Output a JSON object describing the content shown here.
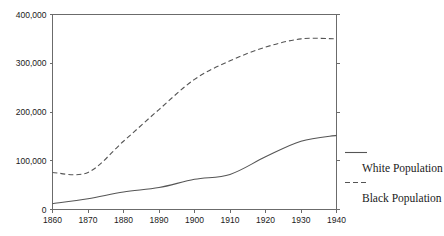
{
  "chart_data": {
    "type": "line",
    "title": "",
    "subtitle": "",
    "xlabel": "",
    "ylabel": "",
    "x": [
      1860,
      1870,
      1880,
      1890,
      1900,
      1910,
      1920,
      1930,
      1940
    ],
    "xlim": [
      1860,
      1940
    ],
    "ylim": [
      0,
      400000
    ],
    "xticks": [
      1860,
      1870,
      1880,
      1890,
      1900,
      1910,
      1920,
      1930,
      1940
    ],
    "xtick_labels": [
      "1860",
      "1870",
      "1880",
      "1890",
      "1900",
      "1910",
      "1920",
      "1930",
      "1940"
    ],
    "yticks": [
      0,
      100000,
      200000,
      300000,
      400000
    ],
    "ytick_labels": [
      "0",
      "100,000",
      "200,000",
      "300,000",
      "400,000"
    ],
    "grid": false,
    "legend_position": "right",
    "series": [
      {
        "name": "White Population",
        "style": "solid",
        "color": "#555555",
        "values": [
          12000,
          22000,
          36000,
          45000,
          62000,
          72000,
          108000,
          140000,
          152000
        ]
      },
      {
        "name": "Black Population",
        "style": "dashed",
        "color": "#555555",
        "values": [
          76000,
          76000,
          140000,
          205000,
          267000,
          305000,
          333000,
          350000,
          350000
        ]
      }
    ]
  },
  "legend": {
    "entries": [
      {
        "label": "White Population",
        "style": "solid"
      },
      {
        "label": "Black Population",
        "style": "dashed"
      }
    ]
  },
  "colors": {
    "axis": "#6b6b6b",
    "series": "#555555",
    "text": "#1a1a1a",
    "background": "#ffffff"
  }
}
